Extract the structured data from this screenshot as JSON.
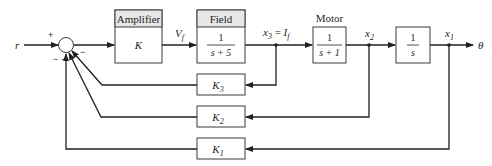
{
  "diagram": {
    "input": "r",
    "output": "θ",
    "summing_junction": {
      "signs": {
        "reference": "+",
        "feedback_1": "−",
        "feedback_2": "−",
        "feedback_3": "−"
      }
    },
    "blocks": {
      "amplifier": {
        "header": "Amplifier",
        "tf": "K"
      },
      "field": {
        "header": "Field",
        "tf_num": "1",
        "tf_den": "s + 5"
      },
      "motor": {
        "header": "Motor",
        "tf_num": "1",
        "tf_den": "s + 1"
      },
      "integrator": {
        "tf_num": "1",
        "tf_den": "s"
      },
      "k3": {
        "base": "K",
        "sub": "3"
      },
      "k2": {
        "base": "K",
        "sub": "2"
      },
      "k1": {
        "base": "K",
        "sub": "1"
      }
    },
    "signals": {
      "vf": {
        "base": "V",
        "sub": "f"
      },
      "x3": {
        "base": "x",
        "sub": "3",
        "eq": " = ",
        "alt_base": "I",
        "alt_sub": "f"
      },
      "x2": {
        "base": "x",
        "sub": "2"
      },
      "x1": {
        "base": "x",
        "sub": "1"
      }
    },
    "colors": {
      "line": "#231f20",
      "header_fill": "#e6e6e6",
      "box_stroke": "#3a3a3a"
    }
  }
}
